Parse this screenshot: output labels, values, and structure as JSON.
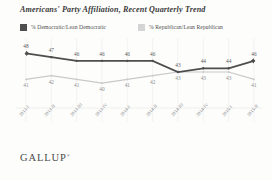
{
  "chart_title": "Americans' Party Affiliation, Recent Quarterly Trend",
  "legend": {
    "democratic_label": "% Democratic/Lean Democratic",
    "republican_label": "% Republican/Lean Republican",
    "democratic_color": "#4e4e4e",
    "republican_color": "#d4d4d4"
  },
  "branding": {
    "logo_text": "GALLUP",
    "logo_mark": "®"
  },
  "chart_data": {
    "type": "line",
    "title": "Americans' Party Affiliation, Recent Quarterly Trend",
    "xlabel": "",
    "ylabel": "",
    "ylim": [
      36,
      50
    ],
    "grid": true,
    "legend_position": "top-left",
    "categories": [
      "2013-I",
      "2013-II",
      "2013-III",
      "2013-IV",
      "2014-I",
      "2014-II",
      "2014-III",
      "2014-IV",
      "2015-I",
      "2015-II"
    ],
    "series": [
      {
        "name": "% Democratic/Lean Democratic",
        "color": "#4e4e4e",
        "values": [
          48,
          47,
          46,
          46,
          46,
          46,
          43,
          44,
          44,
          46
        ]
      },
      {
        "name": "% Republican/Lean Republican",
        "color": "#c9c9c9",
        "values": [
          41,
          42,
          41,
          40,
          41,
          42,
          43,
          43,
          43,
          41
        ]
      }
    ]
  }
}
